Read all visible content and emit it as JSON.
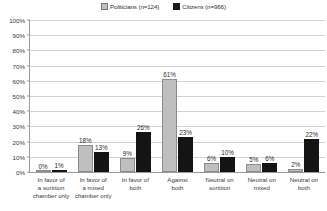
{
  "chart_data": {
    "type": "bar",
    "title": "",
    "subtitle": "",
    "xlabel": "",
    "ylabel": "",
    "ylim": [
      0,
      100
    ],
    "ytick_labels": [
      "0%",
      "10%",
      "20%",
      "30%",
      "40%",
      "50%",
      "60%",
      "70%",
      "80%",
      "90%",
      "100%"
    ],
    "ytick_values": [
      0,
      10,
      20,
      30,
      40,
      50,
      60,
      70,
      80,
      90,
      100
    ],
    "grid": true,
    "legend_position": "top-center",
    "value_labels_suffix": "%",
    "categories": [
      "In favor of a sortition chamber only",
      "In favor of a mixed chamber only",
      "In favor of both",
      "Against both",
      "Neutral on sortition",
      "Neutral on mixed",
      "Neutral on both"
    ],
    "category_lines": [
      [
        "In favor of",
        "a sortition",
        "chamber only"
      ],
      [
        "In favor of",
        "a mixed",
        "chamber only"
      ],
      [
        "In favor of",
        "both"
      ],
      [
        "Against",
        "both"
      ],
      [
        "Neutral on",
        "sortition"
      ],
      [
        "Neutral on",
        "mixed"
      ],
      [
        "Neutral on",
        "both"
      ]
    ],
    "series": [
      {
        "name": "Politicians (n=124)",
        "color": "#bfbfbf",
        "values": [
          0,
          18,
          9,
          61,
          6,
          5,
          2
        ],
        "labels": [
          "0%",
          "18%",
          "9%",
          "61%",
          "6%",
          "5%",
          "2%"
        ]
      },
      {
        "name": "Citizens (n=966)",
        "color": "#141414",
        "values": [
          1,
          13,
          26,
          23,
          10,
          6,
          22
        ],
        "labels": [
          "1%",
          "13%",
          "26%",
          "23%",
          "10%",
          "6%",
          "22%"
        ]
      }
    ]
  },
  "legend": {
    "items": [
      {
        "label": "Politicians (n=124)",
        "swatch": "politicians"
      },
      {
        "label": "Citizens (n=966)",
        "swatch": "citizens"
      }
    ]
  }
}
